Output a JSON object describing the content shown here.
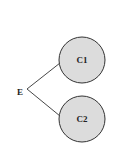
{
  "diagram": {
    "type": "tree",
    "root": {
      "label": "E",
      "x": 20,
      "y": 92
    },
    "junction": {
      "x": 27,
      "y": 89
    },
    "nodes": [
      {
        "id": "c1",
        "label": "C1",
        "cx": 82,
        "cy": 60,
        "r": 23,
        "fill": "#dcdcdc",
        "stroke": "#333333"
      },
      {
        "id": "c2",
        "label": "C2",
        "cx": 82,
        "cy": 119,
        "r": 23,
        "fill": "#dcdcdc",
        "stroke": "#333333"
      }
    ],
    "edges": [
      {
        "from": "E",
        "to": "C1",
        "x1": 27,
        "y1": 89,
        "x2": 60,
        "y2": 63
      },
      {
        "from": "E",
        "to": "C2",
        "x1": 27,
        "y1": 89,
        "x2": 60,
        "y2": 116
      }
    ],
    "colors": {
      "background": "#ffffff",
      "node_fill": "#dcdcdc",
      "stroke": "#333333",
      "text": "#222222"
    }
  }
}
